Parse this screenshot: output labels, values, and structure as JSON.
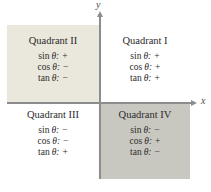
{
  "diagram": {
    "axes": {
      "x_label": "x",
      "y_label": "y"
    },
    "colors": {
      "quadrant_ii_bg": "#eae7dc",
      "quadrant_iv_bg": "#c9c8c0",
      "axis": "#8c8c8c",
      "text": "#2b2b2b"
    },
    "quadrants": [
      {
        "title": "Quadrant I",
        "position": "top-right",
        "lines": [
          {
            "fn": "sin",
            "var": "θ:",
            "sign": "+"
          },
          {
            "fn": "cos",
            "var": "θ:",
            "sign": "+"
          },
          {
            "fn": "tan",
            "var": "θ:",
            "sign": "+"
          }
        ]
      },
      {
        "title": "Quadrant II",
        "position": "top-left",
        "lines": [
          {
            "fn": "sin",
            "var": "θ:",
            "sign": "+"
          },
          {
            "fn": "cos",
            "var": "θ:",
            "sign": "−"
          },
          {
            "fn": "tan",
            "var": "θ:",
            "sign": "−"
          }
        ]
      },
      {
        "title": "Quadrant III",
        "position": "bottom-left",
        "lines": [
          {
            "fn": "sin",
            "var": "θ:",
            "sign": "−"
          },
          {
            "fn": "cos",
            "var": "θ:",
            "sign": "−"
          },
          {
            "fn": "tan",
            "var": "θ:",
            "sign": "+"
          }
        ]
      },
      {
        "title": "Quadrant IV",
        "position": "bottom-right",
        "lines": [
          {
            "fn": "sin",
            "var": "θ:",
            "sign": "−"
          },
          {
            "fn": "cos",
            "var": "θ:",
            "sign": "+"
          },
          {
            "fn": "tan",
            "var": "θ:",
            "sign": "−"
          }
        ]
      }
    ]
  }
}
